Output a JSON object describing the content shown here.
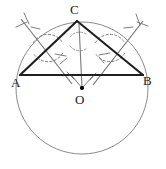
{
  "figure": {
    "kind": "geometry-diagram",
    "width": 166,
    "height": 169,
    "background_color": "#ffffff"
  },
  "labels": {
    "vertex_a": "A",
    "vertex_b": "B",
    "vertex_c": "C",
    "center_o": "O"
  },
  "colors": {
    "stroke_dark": "#1f1f1f",
    "stroke_circle": "#8a8a8a",
    "stroke_construction": "#6f6f6f",
    "label_text": "#1a1a1a",
    "point_fill": "#000000"
  },
  "geometry": {
    "circle": {
      "cx": 82,
      "cy": 88,
      "r": 66
    },
    "points": {
      "A": {
        "x": 20,
        "y": 75
      },
      "B": {
        "x": 143,
        "y": 75
      },
      "C": {
        "x": 77,
        "y": 21
      },
      "O": {
        "x": 82,
        "y": 88
      }
    },
    "triangle_sides": [
      {
        "name": "side-AB",
        "from": "A",
        "to": "B"
      },
      {
        "name": "side-AC",
        "from": "A",
        "to": "C"
      },
      {
        "name": "side-CB",
        "from": "C",
        "to": "B"
      }
    ],
    "median_line": {
      "name": "line-C-O",
      "from": "C",
      "to": "O"
    },
    "construction_lines": [
      {
        "name": "bisector-AC",
        "x1": 22,
        "y1": 20,
        "x2": 70,
        "y2": 80
      },
      {
        "name": "bisector-CB",
        "x1": 142,
        "y1": 22,
        "x2": 95,
        "y2": 82
      }
    ],
    "construction_arcs": [
      {
        "name": "arc-AC-upper",
        "cx": 48,
        "cy": 48,
        "r": 17,
        "start_deg": 200,
        "end_deg": 340
      },
      {
        "name": "arc-AC-lower",
        "cx": 48,
        "cy": 48,
        "r": 17,
        "start_deg": 20,
        "end_deg": 160
      },
      {
        "name": "arc-CB-upper",
        "cx": 110,
        "cy": 48,
        "r": 17,
        "start_deg": 200,
        "end_deg": 340
      },
      {
        "name": "arc-CB-lower",
        "cx": 110,
        "cy": 48,
        "r": 17,
        "start_deg": 20,
        "end_deg": 160
      }
    ]
  }
}
